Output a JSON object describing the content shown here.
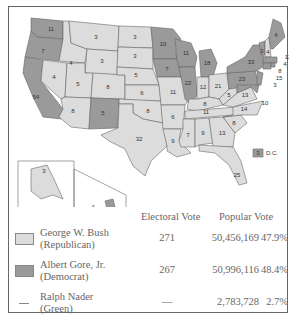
{
  "colors": {
    "republican": "#dcdcdc",
    "democrat": "#9a9a9a",
    "border": "#666666",
    "water": "#ffffff"
  },
  "map": {
    "states": [
      {
        "abbr": "WA",
        "ev": "11",
        "party": "D"
      },
      {
        "abbr": "OR",
        "ev": "7",
        "party": "D"
      },
      {
        "abbr": "CA",
        "ev": "54",
        "party": "D"
      },
      {
        "abbr": "ID",
        "ev": "4",
        "party": "R"
      },
      {
        "abbr": "NV",
        "ev": "4",
        "party": "R"
      },
      {
        "abbr": "MT",
        "ev": "3",
        "party": "R"
      },
      {
        "abbr": "WY",
        "ev": "3",
        "party": "R"
      },
      {
        "abbr": "UT",
        "ev": "5",
        "party": "R"
      },
      {
        "abbr": "AZ",
        "ev": "8",
        "party": "R"
      },
      {
        "abbr": "CO",
        "ev": "8",
        "party": "R"
      },
      {
        "abbr": "NM",
        "ev": "5",
        "party": "D"
      },
      {
        "abbr": "ND",
        "ev": "3",
        "party": "R"
      },
      {
        "abbr": "SD",
        "ev": "3",
        "party": "R"
      },
      {
        "abbr": "NE",
        "ev": "5",
        "party": "R"
      },
      {
        "abbr": "KS",
        "ev": "6",
        "party": "R"
      },
      {
        "abbr": "OK",
        "ev": "8",
        "party": "R"
      },
      {
        "abbr": "TX",
        "ev": "32",
        "party": "R"
      },
      {
        "abbr": "MN",
        "ev": "10",
        "party": "D"
      },
      {
        "abbr": "IA",
        "ev": "7",
        "party": "D"
      },
      {
        "abbr": "MO",
        "ev": "11",
        "party": "R"
      },
      {
        "abbr": "AR",
        "ev": "6",
        "party": "R"
      },
      {
        "abbr": "LA",
        "ev": "9",
        "party": "R"
      },
      {
        "abbr": "WI",
        "ev": "11",
        "party": "D"
      },
      {
        "abbr": "IL",
        "ev": "22",
        "party": "D"
      },
      {
        "abbr": "MI",
        "ev": "18",
        "party": "D"
      },
      {
        "abbr": "IN",
        "ev": "12",
        "party": "R"
      },
      {
        "abbr": "OH",
        "ev": "21",
        "party": "R"
      },
      {
        "abbr": "KY",
        "ev": "8",
        "party": "R"
      },
      {
        "abbr": "TN",
        "ev": "11",
        "party": "R"
      },
      {
        "abbr": "MS",
        "ev": "7",
        "party": "R"
      },
      {
        "abbr": "AL",
        "ev": "9",
        "party": "R"
      },
      {
        "abbr": "GA",
        "ev": "13",
        "party": "R"
      },
      {
        "abbr": "FL",
        "ev": "25",
        "party": "R"
      },
      {
        "abbr": "SC",
        "ev": "8",
        "party": "R"
      },
      {
        "abbr": "NC",
        "ev": "14",
        "party": "R"
      },
      {
        "abbr": "VA",
        "ev": "13",
        "party": "R"
      },
      {
        "abbr": "WV",
        "ev": "5",
        "party": "R"
      },
      {
        "abbr": "PA",
        "ev": "23",
        "party": "D"
      },
      {
        "abbr": "NY",
        "ev": "33",
        "party": "D"
      },
      {
        "abbr": "VT",
        "ev": "3",
        "party": "D"
      },
      {
        "abbr": "NH",
        "ev": "4",
        "party": "R"
      },
      {
        "abbr": "ME",
        "ev": "4",
        "party": "D"
      },
      {
        "abbr": "MA",
        "ev": "12",
        "party": "D"
      },
      {
        "abbr": "RI",
        "ev": "4",
        "party": "D"
      },
      {
        "abbr": "CT",
        "ev": "8",
        "party": "D"
      },
      {
        "abbr": "NJ",
        "ev": "15",
        "party": "D"
      },
      {
        "abbr": "DE",
        "ev": "3",
        "party": "D"
      },
      {
        "abbr": "MD",
        "ev": "10",
        "party": "D"
      },
      {
        "abbr": "AK",
        "ev": "3",
        "party": "R"
      },
      {
        "abbr": "HI",
        "ev": "4",
        "party": "D"
      }
    ],
    "dc": {
      "label": "D.C.",
      "ev": "3",
      "party": "D"
    }
  },
  "legend": {
    "headers": {
      "electoral": "Electoral Vote",
      "popular": "Popular Vote"
    },
    "rows": [
      {
        "name": "George W. Bush",
        "party": "(Republican)",
        "electoral": "271",
        "popular": "50,456,169",
        "percent": "47.9%",
        "swatch": "republican"
      },
      {
        "name": "Albert Gore, Jr.",
        "party": "(Democrat)",
        "electoral": "267",
        "popular": "50,996,116",
        "percent": "48.4%",
        "swatch": "democrat"
      },
      {
        "name": "Ralph Nader",
        "party": "(Green)",
        "electoral": "—",
        "popular": "2,783,728",
        "percent": "2.7%",
        "swatch": "none"
      }
    ]
  }
}
